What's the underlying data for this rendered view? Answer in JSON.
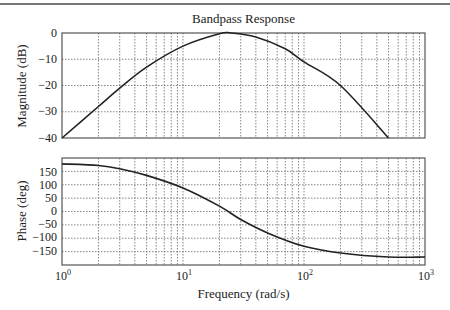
{
  "chart_data": [
    {
      "type": "line",
      "title": "Bandpass Response",
      "xlabel": "Frequency (rad/s)",
      "ylabel": "Magnitude (dB)",
      "xscale": "log",
      "xlim": [
        1,
        1000
      ],
      "ylim": [
        -40,
        0
      ],
      "yticks": [
        0,
        -10,
        -20,
        -30,
        -40
      ],
      "grid": true,
      "series": [
        {
          "name": "Magnitude",
          "x": [
            1,
            2,
            3,
            5,
            10,
            20,
            25,
            40,
            70,
            100,
            200,
            500
          ],
          "y": [
            -40,
            -28,
            -21,
            -13,
            -5,
            -0.3,
            0,
            -1.5,
            -6,
            -11,
            -20,
            -40
          ]
        }
      ]
    },
    {
      "type": "line",
      "title": "",
      "xlabel": "Frequency (rad/s)",
      "ylabel": "Phase (deg)",
      "xscale": "log",
      "xlim": [
        1,
        1000
      ],
      "ylim": [
        -200,
        200
      ],
      "yticks": [
        150,
        100,
        50,
        0,
        -50,
        -100,
        -150
      ],
      "xticks": [
        "10^0",
        "10^1",
        "10^2",
        "10^3"
      ],
      "grid": true,
      "series": [
        {
          "name": "Phase",
          "x": [
            1,
            2,
            3,
            5,
            10,
            20,
            30,
            50,
            100,
            200,
            500,
            1000
          ],
          "y": [
            178,
            172,
            160,
            135,
            88,
            20,
            -30,
            -80,
            -130,
            -155,
            -170,
            -170
          ]
        }
      ]
    }
  ],
  "labels": {
    "title": "Bandpass Response",
    "xlabel": "Frequency (rad/s)",
    "ylabel_top": "Magnitude (dB)",
    "ylabel_bottom": "Phase (deg)",
    "mag_ticks": [
      "0",
      "−10",
      "−20",
      "−30",
      "−40"
    ],
    "phase_ticks": [
      "150",
      "100",
      "50",
      "0",
      "−50",
      "−100",
      "−150"
    ],
    "x_base": "10",
    "x_exps": [
      "0",
      "1",
      "2",
      "3"
    ]
  }
}
